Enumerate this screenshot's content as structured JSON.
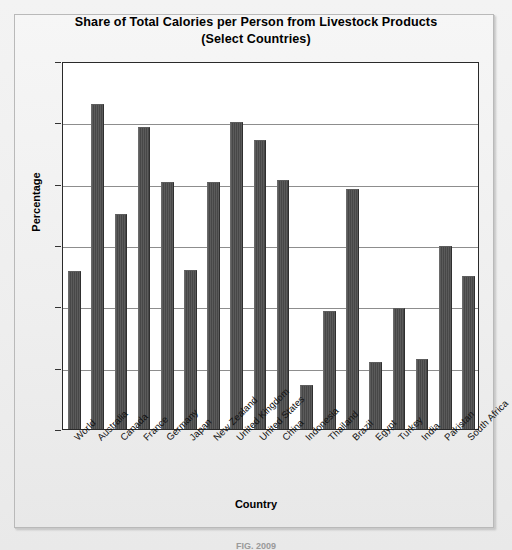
{
  "chart_data": {
    "type": "bar",
    "title": "Share of Total Calories per Person from Livestock Products (Select Countries)",
    "title_line1": "Share of Total Calories per Person from Livestock Products",
    "title_line2": "(Select Countries)",
    "xlabel": "Country",
    "ylabel": "Percentage",
    "ylim": [
      0,
      30
    ],
    "yticks": [
      0,
      5,
      10,
      15,
      20,
      25,
      30
    ],
    "ytick_labels": [
      "0",
      "5",
      "10",
      "15",
      "20",
      "25",
      "30"
    ],
    "grid": true,
    "legend": false,
    "bar_color": "#4b4b4b",
    "categories": [
      "World",
      "Australia",
      "Canada",
      "France",
      "Germany",
      "Japan",
      "New Zealand",
      "United Kingdom",
      "United States",
      "China",
      "Indonesia",
      "Thailand",
      "Brazil",
      "Egypt",
      "Turkey",
      "India",
      "Pakistan",
      "South Africa"
    ],
    "values": [
      12.9,
      26.5,
      17.5,
      24.6,
      20.1,
      13.0,
      20.1,
      25.0,
      23.6,
      20.3,
      3.6,
      9.6,
      19.6,
      5.5,
      9.9,
      5.7,
      14.9,
      12.5
    ]
  },
  "footer": {
    "note": "FIG. 2009"
  }
}
